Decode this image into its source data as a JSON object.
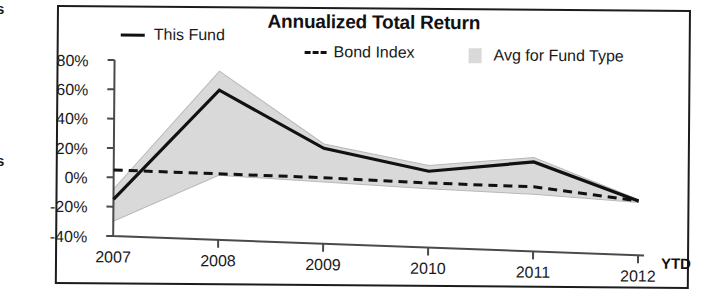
{
  "edge_fragments": {
    "top": "s",
    "middle": "s"
  },
  "header": {
    "title": "Annualized Total Return"
  },
  "legend": {
    "position": "top",
    "entries": [
      {
        "label": "This Fund",
        "marker": "solid-line",
        "color": "#111111"
      },
      {
        "label": "Bond Index",
        "marker": "dashed-line",
        "color": "#111111"
      },
      {
        "label": "Avg for Fund Type",
        "marker": "filled-band",
        "color": "#d9d9d9"
      }
    ]
  },
  "axes": {
    "y_tick_labels": [
      "80%",
      "60%",
      "40%",
      "20%",
      "0%",
      "-20%",
      "-40%"
    ],
    "x_tick_labels": [
      "2007",
      "2008",
      "2009",
      "2010",
      "2011",
      "2012"
    ],
    "x_suffix_label": "YTD"
  },
  "chart_data": {
    "type": "line",
    "title": "Annualized Total Return",
    "xlabel": "",
    "ylabel": "",
    "ylim": [
      -40,
      80
    ],
    "ytick_step": 20,
    "yunit": "%",
    "grid": false,
    "legend_position": "top",
    "categories": [
      "2007",
      "2008",
      "2009",
      "2010",
      "2011",
      "2012 YTD"
    ],
    "series": [
      {
        "name": "This Fund",
        "style": "solid",
        "color": "#111111",
        "values": [
          -15,
          62,
          25,
          12,
          21,
          -3
        ]
      },
      {
        "name": "Bond Index",
        "style": "dashed",
        "color": "#111111",
        "values": [
          5,
          5,
          5,
          4,
          4,
          -3
        ]
      },
      {
        "name": "Avg for Fund Type",
        "style": "band",
        "color": "#d9d9d9",
        "band_upper": [
          -8,
          75,
          28,
          16,
          24,
          -2
        ],
        "band_lower": [
          -30,
          4,
          2,
          0,
          -1,
          -4
        ]
      }
    ]
  },
  "colors": {
    "line": "#111111",
    "band_fill": "#d9d9d9",
    "band_edge": "#b8b8b8",
    "axis": "#4a4a4a",
    "frame": "#1c1c1c"
  }
}
